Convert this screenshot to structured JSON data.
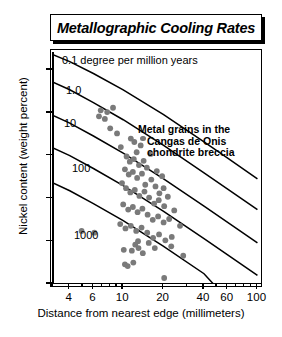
{
  "title": "Metallographic Cooling Rates",
  "annotation": {
    "line1": "Metal grains in the",
    "line2": "Cangas de Onis",
    "line3": "chondrite breccia",
    "marker_color": "#7a7a7a"
  },
  "chart_data": {
    "type": "scatter",
    "title": "Metallographic Cooling Rates",
    "xlabel": "Distance from nearest edge (millimeters)",
    "ylabel": "Nickel content (weight percent)",
    "xscale": "log",
    "yscale": "linear",
    "xlim": [
      3,
      110
    ],
    "ylim": [
      20,
      47
    ],
    "xticks": [
      4,
      6,
      10,
      20,
      40,
      60,
      100
    ],
    "xtick_labels": [
      "4",
      "6",
      "10",
      "20",
      "40",
      "60",
      "100"
    ],
    "yticks": [
      20,
      25,
      30,
      35,
      40,
      45
    ],
    "ytick_labels": [
      "20",
      "25",
      "30",
      "35",
      "40",
      "45"
    ],
    "grid": false,
    "legend_position": "inside-upper-right",
    "point_color": "#7a7a7a",
    "curve_color": "#000000",
    "curve_labels": [
      {
        "label": "0.1 degree per million years",
        "rate": 0.1
      },
      {
        "label": "1.0",
        "rate": 1.0
      },
      {
        "label": "10",
        "rate": 10
      },
      {
        "label": "100",
        "rate": 100
      },
      {
        "label": "1000",
        "rate": 1000
      }
    ],
    "curves": [
      {
        "name": "0.1",
        "points": [
          [
            3,
            46.8
          ],
          [
            4,
            46.0
          ],
          [
            6,
            44.6
          ],
          [
            10,
            42.7
          ],
          [
            20,
            39.8
          ],
          [
            40,
            36.6
          ],
          [
            60,
            34.7
          ],
          [
            100,
            32.3
          ]
        ]
      },
      {
        "name": "1.0",
        "points": [
          [
            3,
            43.6
          ],
          [
            4,
            42.7
          ],
          [
            6,
            41.2
          ],
          [
            10,
            39.2
          ],
          [
            20,
            36.2
          ],
          [
            40,
            33.0
          ],
          [
            60,
            31.1
          ],
          [
            100,
            28.7
          ]
        ]
      },
      {
        "name": "10",
        "points": [
          [
            3,
            39.7
          ],
          [
            4,
            38.8
          ],
          [
            6,
            37.3
          ],
          [
            10,
            35.3
          ],
          [
            20,
            32.3
          ],
          [
            40,
            29.1
          ],
          [
            60,
            27.2
          ],
          [
            100,
            24.8
          ]
        ]
      },
      {
        "name": "100",
        "points": [
          [
            3,
            35.9
          ],
          [
            4,
            35.0
          ],
          [
            6,
            33.5
          ],
          [
            10,
            31.5
          ],
          [
            20,
            28.5
          ],
          [
            40,
            25.3
          ],
          [
            60,
            23.4
          ],
          [
            100,
            21.0
          ]
        ]
      },
      {
        "name": "1000",
        "points": [
          [
            3,
            31.8
          ],
          [
            4,
            30.9
          ],
          [
            6,
            29.4
          ],
          [
            10,
            27.4
          ],
          [
            20,
            24.4
          ],
          [
            40,
            21.2
          ],
          [
            47,
            20.0
          ]
        ]
      }
    ],
    "series": [
      {
        "name": "Metal grains in the Cangas de Onis chondrite breccia",
        "points": [
          [
            6.8,
            40.3
          ],
          [
            7.6,
            40.1
          ],
          [
            6.6,
            39.6
          ],
          [
            7.3,
            39.3
          ],
          [
            8.4,
            40.6
          ],
          [
            9.6,
            36.0
          ],
          [
            11.4,
            37.0
          ],
          [
            12.1,
            36.6
          ],
          [
            12.6,
            35.4
          ],
          [
            13.5,
            36.2
          ],
          [
            10.6,
            34.9
          ],
          [
            11.2,
            34.3
          ],
          [
            12.0,
            34.6
          ],
          [
            13.1,
            33.9
          ],
          [
            14.2,
            34.4
          ],
          [
            10.3,
            33.4
          ],
          [
            11.0,
            32.8
          ],
          [
            11.8,
            33.1
          ],
          [
            12.7,
            32.4
          ],
          [
            13.8,
            32.9
          ],
          [
            15.0,
            33.6
          ],
          [
            16.2,
            32.2
          ],
          [
            17.4,
            31.4
          ],
          [
            18.6,
            30.6
          ],
          [
            20.0,
            31.2
          ],
          [
            9.8,
            31.8
          ],
          [
            10.5,
            31.2
          ],
          [
            11.3,
            30.7
          ],
          [
            12.2,
            31.0
          ],
          [
            13.2,
            30.3
          ],
          [
            14.4,
            30.8
          ],
          [
            15.6,
            30.1
          ],
          [
            17.0,
            29.4
          ],
          [
            18.4,
            29.8
          ],
          [
            20.2,
            29.1
          ],
          [
            10.0,
            29.3
          ],
          [
            10.9,
            28.7
          ],
          [
            11.8,
            29.0
          ],
          [
            12.8,
            28.4
          ],
          [
            13.9,
            28.8
          ],
          [
            15.2,
            28.1
          ],
          [
            16.6,
            27.5
          ],
          [
            18.2,
            27.9
          ],
          [
            20.0,
            27.2
          ],
          [
            22.0,
            27.6
          ],
          [
            9.5,
            27.0
          ],
          [
            10.4,
            26.5
          ],
          [
            11.4,
            26.8
          ],
          [
            12.5,
            26.2
          ],
          [
            13.7,
            26.6
          ],
          [
            15.1,
            26.0
          ],
          [
            16.7,
            25.4
          ],
          [
            18.5,
            25.8
          ],
          [
            20.6,
            25.1
          ],
          [
            23.0,
            25.5
          ],
          [
            4.9,
            26.2
          ],
          [
            6.1,
            26.0
          ],
          [
            10.1,
            24.0
          ],
          [
            11.6,
            23.9
          ],
          [
            12.9,
            25.0
          ],
          [
            10.3,
            22.3
          ],
          [
            10.8,
            22.1
          ],
          [
            11.9,
            22.5
          ],
          [
            20.2,
            20.7
          ],
          [
            28.0,
            23.3
          ],
          [
            8.0,
            38.2
          ],
          [
            9.0,
            37.6
          ],
          [
            14.6,
            31.6
          ],
          [
            16.0,
            35.2
          ],
          [
            17.8,
            33.2
          ],
          [
            19.5,
            32.6
          ],
          [
            21.5,
            30.2
          ],
          [
            24.0,
            28.6
          ],
          [
            26.5,
            26.8
          ],
          [
            22.8,
            24.4
          ],
          [
            12.3,
            24.6
          ],
          [
            13.0,
            24.2
          ],
          [
            14.0,
            23.6
          ],
          [
            15.5,
            24.8
          ],
          [
            17.2,
            24.2
          ]
        ]
      }
    ]
  },
  "axes": {
    "x_title": "Distance from nearest edge (millimeters)",
    "y_title": "Nickel content (weight percent)"
  }
}
